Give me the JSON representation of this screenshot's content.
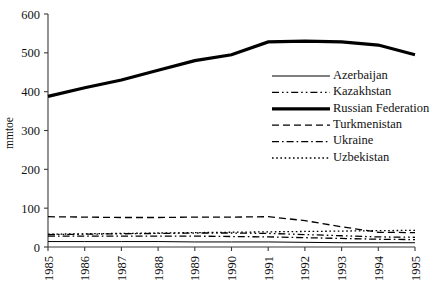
{
  "chart_data": {
    "type": "line",
    "title": "",
    "xlabel": "",
    "ylabel": "mmtoe",
    "ylim": [
      0,
      600
    ],
    "yticks": [
      0,
      100,
      200,
      300,
      400,
      500,
      600
    ],
    "x": [
      1985,
      1986,
      1987,
      1988,
      1989,
      1990,
      1991,
      1992,
      1993,
      1994,
      1995
    ],
    "xticklabels": [
      "1985",
      "1986",
      "1987",
      "1988",
      "1989",
      "1990",
      "1991",
      "1992",
      "1993",
      "1994",
      "1995"
    ],
    "grid": false,
    "legend_position": "center-right",
    "series": [
      {
        "name": "Azerbaijan",
        "style": "solid-thin",
        "values": [
          14,
          14,
          14,
          14,
          13,
          13,
          13,
          12,
          11,
          11,
          11
        ]
      },
      {
        "name": "Kazakhstan",
        "style": "dash-dot-dot",
        "values": [
          32,
          33,
          34,
          35,
          36,
          36,
          35,
          32,
          29,
          26,
          25
        ]
      },
      {
        "name": "Russian Federation",
        "style": "solid-thick",
        "values": [
          388,
          410,
          430,
          455,
          480,
          495,
          528,
          530,
          528,
          520,
          495
        ]
      },
      {
        "name": "Turkmenistan",
        "style": "dashed",
        "values": [
          78,
          77,
          76,
          76,
          77,
          77,
          78,
          68,
          52,
          38,
          37
        ]
      },
      {
        "name": "Ukraine",
        "style": "dash-dot",
        "values": [
          28,
          28,
          28,
          28,
          28,
          27,
          26,
          24,
          22,
          20,
          19
        ]
      },
      {
        "name": "Uzbekistan",
        "style": "dotted",
        "values": [
          33,
          34,
          35,
          36,
          37,
          38,
          39,
          40,
          41,
          42,
          43
        ]
      }
    ]
  },
  "legend": {
    "items": [
      {
        "label": "Azerbaijan"
      },
      {
        "label": "Kazakhstan"
      },
      {
        "label": "Russian Federation"
      },
      {
        "label": "Turkmenistan"
      },
      {
        "label": "Ukraine"
      },
      {
        "label": "Uzbekistan"
      }
    ]
  },
  "colors": {
    "line": "#000000",
    "axis": "#3a3a3a",
    "text": "#111111",
    "background": "#ffffff"
  }
}
